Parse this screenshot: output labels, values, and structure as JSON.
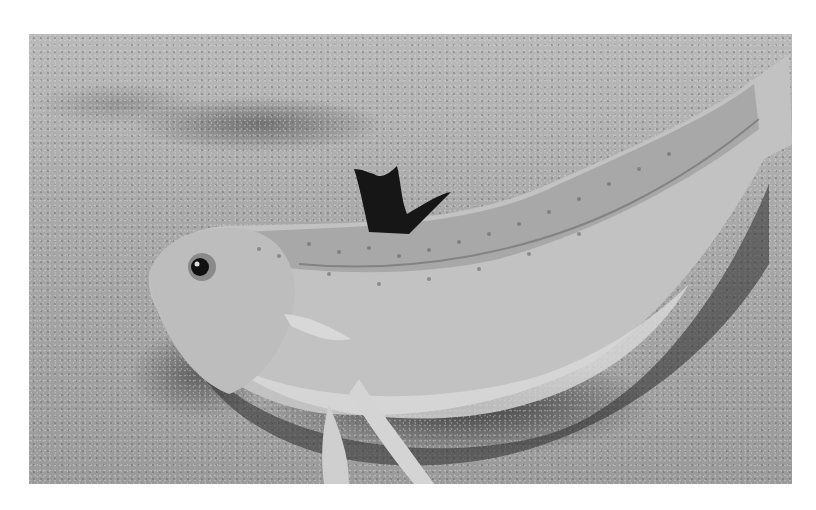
{
  "image": {
    "subject": "fish resting on sand",
    "description": "Grayscale photograph of a speckled elongated fish (weever-like) lying on a sandy seabed, with raised black dorsal fin spines and a shadow beneath its body",
    "colors": {
      "background": "#ffffff",
      "sand": "#a9a9a9",
      "fish_body": "#c4c4c4",
      "dorsal_fin": "#1a1a1a",
      "shadow": "#2a2a2a"
    }
  }
}
